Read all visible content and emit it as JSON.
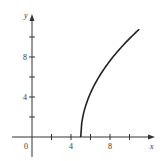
{
  "chart_data": {
    "type": "line",
    "title": "",
    "xlabel": "x",
    "ylabel": "y",
    "origin_label": "0",
    "x_ticks": [
      2,
      4,
      6,
      8,
      10
    ],
    "x_tick_labels": [
      {
        "value": 4,
        "label": "4"
      },
      {
        "value": 8,
        "label": "8"
      }
    ],
    "y_ticks": [
      2,
      4,
      6,
      8,
      10
    ],
    "y_tick_labels": [
      {
        "value": 4,
        "label": "4"
      },
      {
        "value": 8,
        "label": "8"
      }
    ],
    "xlim": [
      -2,
      12
    ],
    "ylim": [
      -2,
      12
    ],
    "grid": false,
    "series": [
      {
        "name": "curve",
        "description": "y = 4.4*sqrt(x-5), starting at (5,0)",
        "x": [
          5,
          5.1,
          5.5,
          6,
          7,
          8,
          9,
          10,
          11
        ],
        "values": [
          0,
          1.4,
          3.1,
          4.4,
          6.2,
          7.6,
          8.8,
          9.8,
          10.8
        ]
      }
    ]
  }
}
